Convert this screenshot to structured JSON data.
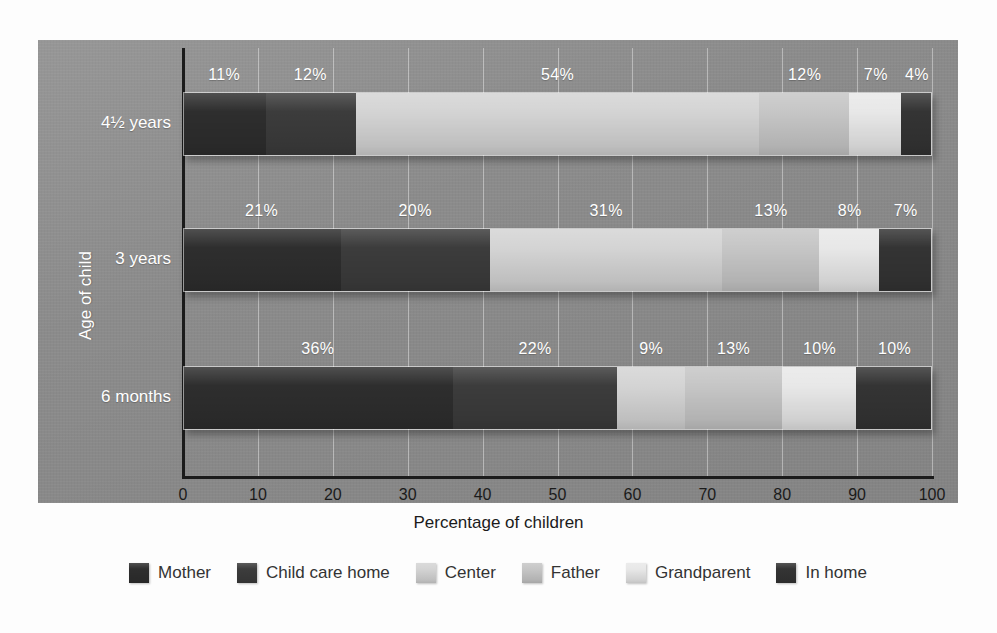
{
  "chart_data": {
    "type": "bar",
    "orientation": "horizontal",
    "stacked": true,
    "title": "",
    "xlabel": "Percentage of children",
    "ylabel": "Age of child",
    "xlim": [
      0,
      100
    ],
    "xticks": [
      0,
      10,
      20,
      30,
      40,
      50,
      60,
      70,
      80,
      90,
      100
    ],
    "xtick_labels": [
      "0",
      "10",
      "20",
      "30",
      "40",
      "50",
      "60",
      "70",
      "80",
      "90",
      "100"
    ],
    "grid": "vertical",
    "legend_position": "bottom",
    "categories": [
      "4½ years",
      "3 years",
      "6 months"
    ],
    "series": [
      {
        "name": "Mother",
        "color": "#2e2e2e",
        "values": [
          11,
          21,
          36
        ]
      },
      {
        "name": "Child care home",
        "color": "#3c3c3c",
        "values": [
          12,
          20,
          22
        ]
      },
      {
        "name": "Center",
        "color": "#d4d4d4",
        "values": [
          54,
          31,
          9
        ]
      },
      {
        "name": "Father",
        "color": "#c6c6c6",
        "values": [
          12,
          13,
          13
        ]
      },
      {
        "name": "Grandparent",
        "color": "#e8e8e8",
        "values": [
          7,
          8,
          10
        ]
      },
      {
        "name": "In home",
        "color": "#343434",
        "values": [
          4,
          7,
          10
        ]
      }
    ],
    "bars": [
      {
        "category": "4½ years",
        "segments": [
          {
            "series": "Mother",
            "value": 11,
            "label": "11%"
          },
          {
            "series": "Child care home",
            "value": 12,
            "label": "12%"
          },
          {
            "series": "Center",
            "value": 54,
            "label": "54%"
          },
          {
            "series": "Father",
            "value": 12,
            "label": "12%"
          },
          {
            "series": "Grandparent",
            "value": 7,
            "label": "7%"
          },
          {
            "series": "In home",
            "value": 4,
            "label": "4%"
          }
        ]
      },
      {
        "category": "3 years",
        "segments": [
          {
            "series": "Mother",
            "value": 21,
            "label": "21%"
          },
          {
            "series": "Child care home",
            "value": 20,
            "label": "20%"
          },
          {
            "series": "Center",
            "value": 31,
            "label": "31%"
          },
          {
            "series": "Father",
            "value": 13,
            "label": "13%"
          },
          {
            "series": "Grandparent",
            "value": 8,
            "label": "8%"
          },
          {
            "series": "In home",
            "value": 7,
            "label": "7%"
          }
        ]
      },
      {
        "category": "6 months",
        "segments": [
          {
            "series": "Mother",
            "value": 36,
            "label": "36%"
          },
          {
            "series": "Child care home",
            "value": 22,
            "label": "22%"
          },
          {
            "series": "Center",
            "value": 9,
            "label": "9%"
          },
          {
            "series": "Father",
            "value": 13,
            "label": "13%"
          },
          {
            "series": "Grandparent",
            "value": 10,
            "label": "10%"
          },
          {
            "series": "In home",
            "value": 10,
            "label": "10%"
          }
        ]
      }
    ]
  },
  "legend": {
    "items": [
      {
        "label": "Mother",
        "color": "#2e2e2e"
      },
      {
        "label": "Child care home",
        "color": "#3c3c3c"
      },
      {
        "label": "Center",
        "color": "#d4d4d4"
      },
      {
        "label": "Father",
        "color": "#c6c6c6"
      },
      {
        "label": "Grandparent",
        "color": "#e8e8e8"
      },
      {
        "label": "In home",
        "color": "#343434"
      }
    ]
  },
  "colors": {
    "panel_background": "#8b8b8b",
    "page_background": "#fdfdfd",
    "axis": "#1b1b1b",
    "gridline": "#d8d8d8",
    "bar_label_text": "#ffffff",
    "axis_text": "#1b1b1b",
    "legend_text": "#333333"
  }
}
